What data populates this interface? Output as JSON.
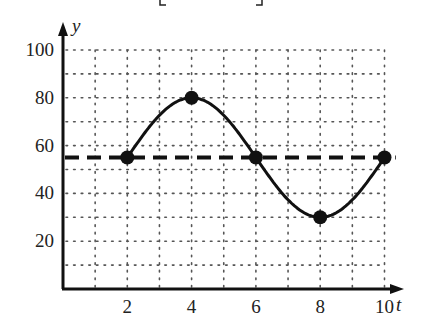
{
  "chart_data": {
    "type": "line",
    "title": "",
    "xlabel": "t",
    "ylabel": "y",
    "xlim": [
      0,
      10.5
    ],
    "ylim": [
      0,
      100
    ],
    "x_ticks": [
      2,
      4,
      6,
      8,
      10
    ],
    "y_ticks": [
      20,
      40,
      60,
      80,
      100
    ],
    "x_tick_labels": [
      "2",
      "4",
      "6",
      "8",
      "10"
    ],
    "y_tick_labels": [
      "20",
      "40",
      "60",
      "80",
      "100"
    ],
    "grid": {
      "on": true,
      "style": "dotted",
      "x_step": 1,
      "y_step": 10
    },
    "series": [
      {
        "name": "curve",
        "style": "solid",
        "shape": "sinusoid",
        "x": [
          2,
          4,
          6,
          8,
          10
        ],
        "y": [
          55,
          80,
          55,
          30,
          55
        ],
        "marked_points": true
      },
      {
        "name": "midline",
        "style": "dashed",
        "x": [
          0,
          10.5
        ],
        "y": [
          55,
          55
        ]
      }
    ],
    "top_fragment": "[ ,  ]"
  }
}
